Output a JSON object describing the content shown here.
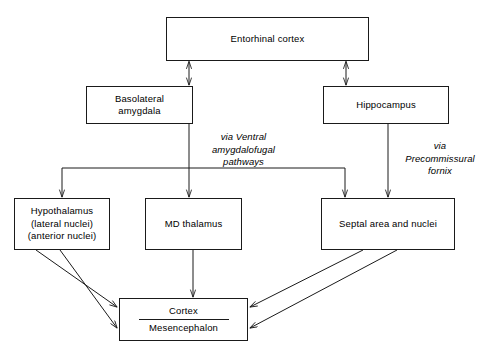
{
  "diagram": {
    "stroke_color": "#1a1a1a",
    "background_color": "#ffffff",
    "nodes": {
      "entorhinal_cortex": {
        "label": "Entorhinal cortex"
      },
      "basolateral_amygdala": {
        "line1": "Basolateral",
        "line2": "amygdala"
      },
      "hippocampus": {
        "label": "Hippocampus"
      },
      "hypothalamus": {
        "line1": "Hypothalamus",
        "line2": "(lateral nuclei)",
        "line3": "(anterior nuclei)"
      },
      "md_thalamus": {
        "label": "MD thalamus"
      },
      "septal_area": {
        "label": "Septal area and nuclei"
      },
      "cortex_mesencephalon": {
        "upper": "Cortex",
        "lower": "Mesencephalon"
      }
    },
    "edge_labels": {
      "ventral_amygdalofugal": {
        "line1": "via Ventral",
        "line2": "amygdalofugal",
        "line3": "pathways"
      },
      "precommissural_fornix": {
        "line1": "via",
        "line2": "Precommissural",
        "line3": "fornix"
      }
    }
  }
}
